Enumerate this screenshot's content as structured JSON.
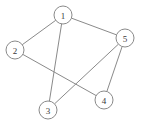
{
  "diagram": {
    "background_color": "#ffffff",
    "edge_color": "#8a8a8a",
    "node_fill_color": "#ffffff",
    "node_stroke_color": "#8a8a8a",
    "label_color": "#3a3a3a",
    "node_radius": 9
  },
  "chart_data": {
    "type": "diagram",
    "title": "",
    "nodes": [
      {
        "id": "1",
        "label": "1",
        "x": 63,
        "y": 15
      },
      {
        "id": "2",
        "label": "2",
        "x": 15,
        "y": 50
      },
      {
        "id": "3",
        "label": "3",
        "x": 48,
        "y": 110
      },
      {
        "id": "4",
        "label": "4",
        "x": 104,
        "y": 100
      },
      {
        "id": "5",
        "label": "5",
        "x": 125,
        "y": 38
      }
    ],
    "edges": [
      {
        "source": "1",
        "target": "2"
      },
      {
        "source": "1",
        "target": "3"
      },
      {
        "source": "1",
        "target": "5"
      },
      {
        "source": "2",
        "target": "4"
      },
      {
        "source": "3",
        "target": "5"
      },
      {
        "source": "4",
        "target": "5"
      }
    ],
    "node_count": 5,
    "edge_count": 6,
    "degrees": {
      "1": 3,
      "2": 2,
      "3": 2,
      "4": 2,
      "5": 3
    }
  }
}
